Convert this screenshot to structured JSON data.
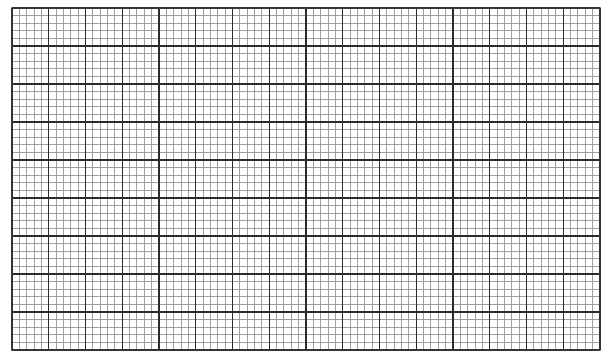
{
  "sheet": {
    "type": "graph-paper",
    "major_columns": 16,
    "major_rows": 9,
    "minor_per_major": 5,
    "colors": {
      "background": "#ffffff",
      "major_line": "#2b2b2b",
      "minor_line": "#8a8a8a",
      "border": "#3a3a3a"
    }
  }
}
